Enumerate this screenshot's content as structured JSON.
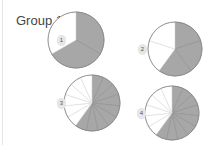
{
  "title": "Group 1",
  "colors": {
    "shaded": "#a7a7a7",
    "unshaded": "#ffffff",
    "stroke": "#8a8a8a"
  },
  "chart_data": {
    "type": "pie",
    "title": "Group 1",
    "pies": [
      {
        "label": "1",
        "slices": 3,
        "shaded": 2,
        "cx": 76,
        "cy": 40,
        "r": 28,
        "badge": [
          57,
          35
        ]
      },
      {
        "label": "2",
        "slices": 5,
        "shaded": 3,
        "cx": 175,
        "cy": 49,
        "r": 27,
        "badge": [
          138,
          44
        ]
      },
      {
        "label": "3",
        "slices": 15,
        "shaded": 9,
        "cx": 92,
        "cy": 103,
        "r": 28,
        "badge": [
          57,
          98
        ]
      },
      {
        "label": "4",
        "slices": 15,
        "shaded": 9,
        "cx": 172,
        "cy": 113,
        "r": 27,
        "badge": [
          137,
          108
        ]
      }
    ]
  }
}
